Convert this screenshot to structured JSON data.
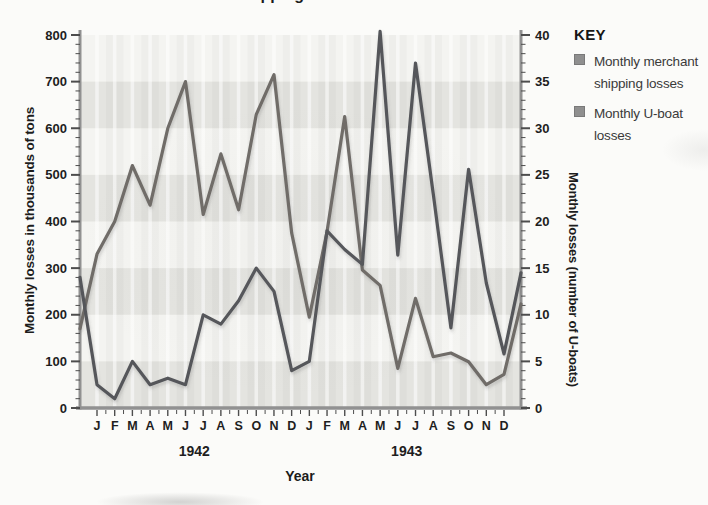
{
  "page": {
    "title_fragment": "Merchant shipping losses"
  },
  "legend": {
    "title": "KEY",
    "items": [
      {
        "label": "Monthly merchant shipping losses",
        "swatch_color": "#8f8f8f"
      },
      {
        "label": "Monthly U-boat losses",
        "swatch_color": "#8f8f8f"
      }
    ]
  },
  "axis_titles": {
    "left": "Monthly losses in thousands of tons",
    "right": "Monthly losses (number of U-boats)",
    "x": "Year"
  },
  "chart_data": {
    "type": "line",
    "xlabel": "Year",
    "x_months": [
      "J",
      "F",
      "M",
      "A",
      "M",
      "J",
      "J",
      "A",
      "S",
      "O",
      "N",
      "D",
      "J",
      "F",
      "M",
      "A",
      "M",
      "J",
      "J",
      "A",
      "S",
      "O",
      "N",
      "D"
    ],
    "year_labels": [
      "1942",
      "1943"
    ],
    "left_axis": {
      "label": "Monthly losses in thousands of tons",
      "min": 0,
      "max": 800,
      "tick_step": 100,
      "ticks": [
        0,
        100,
        200,
        300,
        400,
        500,
        600,
        700,
        800
      ]
    },
    "right_axis": {
      "label": "Monthly losses (number of U-boats)",
      "min": 0,
      "max": 40,
      "tick_step": 5,
      "ticks": [
        0,
        5,
        10,
        15,
        20,
        25,
        30,
        35,
        40
      ]
    },
    "gray_bands_left_scale": [
      [
        0,
        100
      ],
      [
        200,
        300
      ],
      [
        400,
        500
      ],
      [
        600,
        700
      ]
    ],
    "legend_position": "right",
    "grid": "vertical-white-lines",
    "series": [
      {
        "name": "Monthly merchant shipping losses",
        "axis": "left",
        "units": "thousands of tons",
        "color": "#6f6c68",
        "edge_start": 170,
        "values": [
          330,
          400,
          520,
          435,
          600,
          700,
          415,
          545,
          425,
          630,
          715,
          375,
          195,
          378,
          625,
          296,
          263,
          85,
          235,
          110,
          118,
          99,
          50,
          72
        ],
        "edge_end": 223
      },
      {
        "name": "Monthly U-boat losses",
        "axis": "right",
        "units": "number of U-boats",
        "color": "#54565a",
        "edge_start": 14,
        "values": [
          2.5,
          1,
          5,
          2.5,
          3.2,
          2.5,
          10,
          9,
          11.5,
          15,
          12.5,
          4,
          5,
          19,
          17,
          15.4,
          40.4,
          16.4,
          37,
          23,
          8.6,
          25.6,
          13.4,
          5.8
        ],
        "edge_end": 14.5
      }
    ]
  },
  "colors": {
    "plot_bg": "#f4f4f1",
    "gray_band": "#e4e4e0",
    "axis_line": "#919191",
    "tick": "#4d4d4d",
    "tick_label": "#1e1e1e"
  }
}
